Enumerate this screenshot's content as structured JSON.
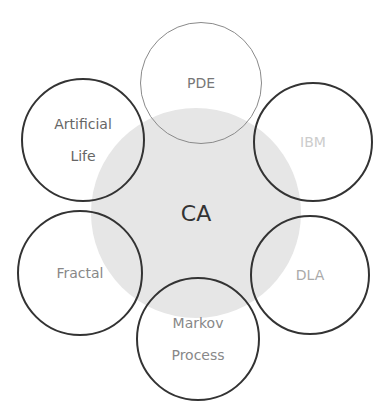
{
  "diagram": {
    "center": {
      "label": "CA",
      "x": 196,
      "y": 213,
      "r": 105,
      "fill": "#e6e6e6",
      "text_color": "#333333"
    },
    "nodes": [
      {
        "id": "pde",
        "label": "PDE",
        "x": 201,
        "y": 83,
        "r": 61,
        "stroke": "#8a8a8a",
        "stroke_width": 1.5,
        "text_color": "#777777"
      },
      {
        "id": "artificial-life",
        "label": "Artificial\nLife",
        "x": 83,
        "y": 140,
        "r": 62,
        "stroke": "#333333",
        "stroke_width": 2,
        "text_color": "#666666"
      },
      {
        "id": "ibm",
        "label": "IBM",
        "x": 313,
        "y": 142,
        "r": 60,
        "stroke": "#333333",
        "stroke_width": 2,
        "text_color": "#cccccc"
      },
      {
        "id": "fractal",
        "label": "Fractal",
        "x": 80,
        "y": 273,
        "r": 63,
        "stroke": "#333333",
        "stroke_width": 2,
        "text_color": "#888888"
      },
      {
        "id": "dla",
        "label": "DLA",
        "x": 310,
        "y": 275,
        "r": 60,
        "stroke": "#333333",
        "stroke_width": 2,
        "text_color": "#aaaaaa"
      },
      {
        "id": "markov-process",
        "label": "Markov\nProcess",
        "x": 198,
        "y": 339,
        "r": 62,
        "stroke": "#333333",
        "stroke_width": 2,
        "text_color": "#888888"
      }
    ]
  }
}
